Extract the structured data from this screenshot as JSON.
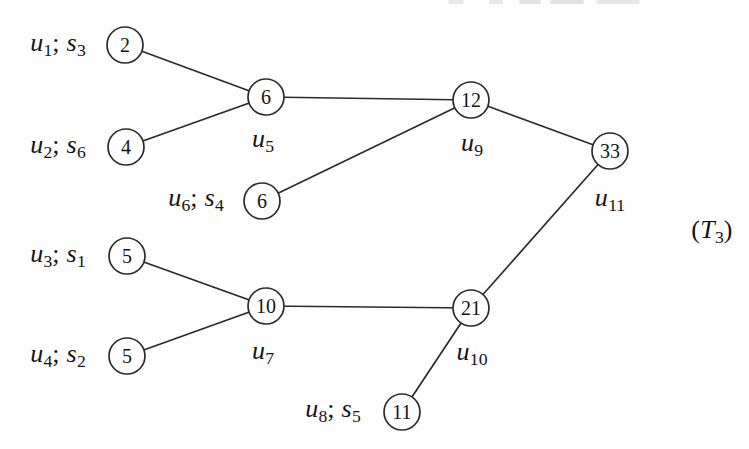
{
  "figure": {
    "background": "#fefefe",
    "stroke_color": "#2b2b2b",
    "text_color": "#141414",
    "node_radius": 18,
    "nodes": [
      {
        "id": "n2",
        "value": "2",
        "x": 125,
        "y": 45
      },
      {
        "id": "n4",
        "value": "4",
        "x": 126,
        "y": 147
      },
      {
        "id": "n6a",
        "value": "6",
        "x": 266,
        "y": 97
      },
      {
        "id": "n6b",
        "value": "6",
        "x": 262,
        "y": 201
      },
      {
        "id": "n12",
        "value": "12",
        "x": 471,
        "y": 100
      },
      {
        "id": "n33",
        "value": "33",
        "x": 610,
        "y": 151
      },
      {
        "id": "n5a",
        "value": "5",
        "x": 127,
        "y": 256
      },
      {
        "id": "n5b",
        "value": "5",
        "x": 127,
        "y": 356
      },
      {
        "id": "n10",
        "value": "10",
        "x": 266,
        "y": 306
      },
      {
        "id": "n21",
        "value": "21",
        "x": 471,
        "y": 308
      },
      {
        "id": "n11",
        "value": "11",
        "x": 402,
        "y": 412
      }
    ],
    "edges": [
      {
        "from": "n2",
        "to": "n6a"
      },
      {
        "from": "n4",
        "to": "n6a"
      },
      {
        "from": "n6a",
        "to": "n12"
      },
      {
        "from": "n6b",
        "to": "n12"
      },
      {
        "from": "n12",
        "to": "n33"
      },
      {
        "from": "n33",
        "to": "n21"
      },
      {
        "from": "n5a",
        "to": "n10"
      },
      {
        "from": "n5b",
        "to": "n10"
      },
      {
        "from": "n10",
        "to": "n21"
      },
      {
        "from": "n21",
        "to": "n11"
      }
    ],
    "labels": [
      {
        "id": "label-u1-s3",
        "text": "u1; s3",
        "x": 58,
        "y": 45,
        "segments": [
          {
            "t": "u",
            "italic": true,
            "sub": "1"
          },
          {
            "t": "; "
          },
          {
            "t": "s",
            "italic": true,
            "sub": "3"
          }
        ]
      },
      {
        "id": "label-u2-s6",
        "text": "u2; s6",
        "x": 58,
        "y": 147,
        "segments": [
          {
            "t": "u",
            "italic": true,
            "sub": "2"
          },
          {
            "t": "; "
          },
          {
            "t": "s",
            "italic": true,
            "sub": "6"
          }
        ]
      },
      {
        "id": "label-u5",
        "text": "u5",
        "x": 263,
        "y": 141,
        "segments": [
          {
            "t": "u",
            "italic": true,
            "sub": "5"
          }
        ]
      },
      {
        "id": "label-u6-s4",
        "text": "u6; s4",
        "x": 196,
        "y": 200,
        "segments": [
          {
            "t": "u",
            "italic": true,
            "sub": "6"
          },
          {
            "t": "; "
          },
          {
            "t": "s",
            "italic": true,
            "sub": "4"
          }
        ]
      },
      {
        "id": "label-u9",
        "text": "u9",
        "x": 472,
        "y": 145,
        "segments": [
          {
            "t": "u",
            "italic": true,
            "sub": "9"
          }
        ]
      },
      {
        "id": "label-u11",
        "text": "u11",
        "x": 610,
        "y": 200,
        "segments": [
          {
            "t": "u",
            "italic": true,
            "sub": "11"
          }
        ]
      },
      {
        "id": "label-u3-s1",
        "text": "u3; s1",
        "x": 58,
        "y": 256,
        "segments": [
          {
            "t": "u",
            "italic": true,
            "sub": "3"
          },
          {
            "t": "; "
          },
          {
            "t": "s",
            "italic": true,
            "sub": "1"
          }
        ]
      },
      {
        "id": "label-u4-s2",
        "text": "u4; s2",
        "x": 58,
        "y": 356,
        "segments": [
          {
            "t": "u",
            "italic": true,
            "sub": "4"
          },
          {
            "t": "; "
          },
          {
            "t": "s",
            "italic": true,
            "sub": "2"
          }
        ]
      },
      {
        "id": "label-u7",
        "text": "u7",
        "x": 263,
        "y": 353,
        "segments": [
          {
            "t": "u",
            "italic": true,
            "sub": "7"
          }
        ]
      },
      {
        "id": "label-u8-s5",
        "text": "u8; s5",
        "x": 333,
        "y": 411,
        "segments": [
          {
            "t": "u",
            "italic": true,
            "sub": "8"
          },
          {
            "t": "; "
          },
          {
            "t": "s",
            "italic": true,
            "sub": "5"
          }
        ]
      },
      {
        "id": "label-u10",
        "text": "u10",
        "x": 472,
        "y": 354,
        "segments": [
          {
            "t": "u",
            "italic": true,
            "sub": "10"
          }
        ]
      },
      {
        "id": "label-tree-tag",
        "text": "(T3)",
        "x": 712,
        "y": 232,
        "segments": [
          {
            "t": "("
          },
          {
            "t": "T",
            "italic": true,
            "sub": "3"
          },
          {
            "t": ")"
          }
        ]
      }
    ]
  }
}
